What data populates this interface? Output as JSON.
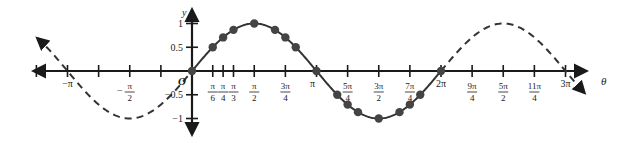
{
  "chart_data": {
    "type": "line",
    "title": "",
    "xlabel": "θ",
    "ylabel": "y",
    "function": "y = sin θ",
    "xlim_labels": [
      "-π",
      "3π"
    ],
    "ylim": [
      -1,
      1
    ],
    "grid": false,
    "x_ticks": [
      {
        "value": -3.14159,
        "label": "−π"
      },
      {
        "value": -1.5708,
        "label": "−π/2"
      },
      {
        "value": 0.5236,
        "label": "π/6"
      },
      {
        "value": 0.7854,
        "label": "π/4"
      },
      {
        "value": 1.0472,
        "label": "π/3"
      },
      {
        "value": 1.5708,
        "label": "π/2"
      },
      {
        "value": 2.3562,
        "label": "3π/4"
      },
      {
        "value": 3.14159,
        "label": "π"
      },
      {
        "value": 3.927,
        "label": "5π/4"
      },
      {
        "value": 4.7124,
        "label": "3π/2"
      },
      {
        "value": 5.4978,
        "label": "7π/4"
      },
      {
        "value": 6.28318,
        "label": "2π"
      },
      {
        "value": 7.0686,
        "label": "9π/4"
      },
      {
        "value": 7.854,
        "label": "5π/2"
      },
      {
        "value": 8.6394,
        "label": "11π/4"
      },
      {
        "value": 9.42478,
        "label": "3π"
      }
    ],
    "y_ticks": [
      {
        "value": 1,
        "label": "1"
      },
      {
        "value": 0.5,
        "label": "0.5"
      },
      {
        "value": -0.5,
        "label": "−0.5"
      },
      {
        "value": -1,
        "label": "−1"
      }
    ],
    "origin_label": "O",
    "series": [
      {
        "name": "sin θ (one period, solid with points)",
        "style": "solid",
        "x": [
          0,
          0.5236,
          0.7854,
          1.0472,
          1.5708,
          2.0944,
          2.3562,
          2.618,
          3.14159,
          3.6652,
          3.927,
          4.1888,
          4.7124,
          5.236,
          5.4978,
          5.7596,
          6.28318
        ],
        "values": [
          0,
          0.5,
          0.707,
          0.866,
          1,
          0.866,
          0.707,
          0.5,
          0,
          -0.5,
          -0.707,
          -0.866,
          -1,
          -0.866,
          -0.707,
          -0.5,
          0
        ]
      },
      {
        "name": "sin θ (extension, dashed)",
        "style": "dashed",
        "x_range": [
          -3.9,
          0
        ],
        "x_range_2": [
          6.28318,
          9.9
        ]
      }
    ]
  },
  "labels": {
    "y_axis": "y",
    "x_axis": "θ",
    "origin": "O"
  }
}
